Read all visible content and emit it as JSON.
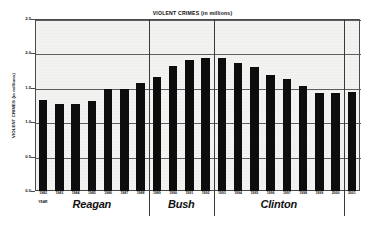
{
  "chart_data": {
    "type": "bar",
    "title": "VIOLENT CRIMES (in millions)",
    "xlabel": "YEAR",
    "ylabel": "VIOLENT CRIMES (in millions)",
    "ylim": [
      0.0,
      2.5
    ],
    "grid": true,
    "legend": "none",
    "categories": [
      "1982",
      "1983",
      "1984",
      "1985",
      "1986",
      "1987",
      "1988",
      "1989",
      "1990",
      "1991",
      "1992",
      "1993",
      "1994",
      "1995",
      "1996",
      "1997",
      "1998",
      "1999",
      "2000",
      "2001"
    ],
    "values": [
      1.32,
      1.26,
      1.27,
      1.31,
      1.49,
      1.48,
      1.57,
      1.65,
      1.82,
      1.91,
      1.93,
      1.93,
      1.86,
      1.8,
      1.69,
      1.63,
      1.53,
      1.43,
      1.43,
      1.44
    ],
    "ytick_labels": [
      "0.0",
      "0.5",
      "1.0",
      "1.5",
      "2.0",
      "2.5"
    ],
    "ytick_values": [
      0.0,
      0.5,
      1.0,
      1.5,
      2.0,
      2.5
    ],
    "bar_color": "#0d0d0d",
    "plot_background": "#f2f2f0",
    "gridline_color": "#5d5d5d",
    "annotations": [
      {
        "label": "Reagan",
        "start_category": "1982",
        "end_category": "1988"
      },
      {
        "label": "Bush",
        "start_category": "1989",
        "end_category": "1992"
      },
      {
        "label": "Clinton",
        "start_category": "1993",
        "end_category": "2000"
      }
    ],
    "term_separator_after": [
      "1988",
      "1992",
      "2000"
    ]
  }
}
